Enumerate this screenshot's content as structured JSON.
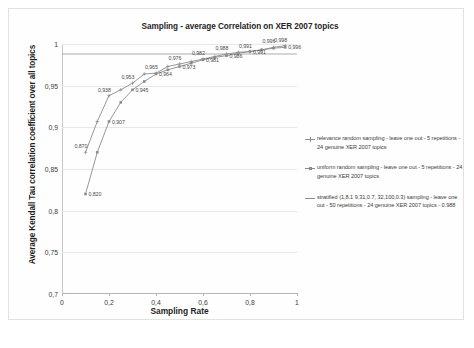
{
  "chart_data": {
    "type": "line",
    "title": "Sampling -  average Correlation on XER 2007 topics",
    "xlabel": "Sampling Rate",
    "ylabel": "Average Kendall Tau correlation coefficient over all topics",
    "xlim": [
      0,
      1
    ],
    "ylim": [
      0.7,
      1
    ],
    "grid": true,
    "legend_position": "right",
    "x_ticks": [
      "0",
      "0,2",
      "0,4",
      "0,6",
      "0,8",
      "1"
    ],
    "x_tick_values": [
      0,
      0.2,
      0.4,
      0.6,
      0.8,
      1
    ],
    "y_ticks": [
      "0,7",
      "0,75",
      "0,8",
      "0,85",
      "0,9",
      "0,95",
      "1"
    ],
    "y_tick_values": [
      0.7,
      0.75,
      0.8,
      0.85,
      0.9,
      0.95,
      1
    ],
    "series": [
      {
        "name": "relevance random sampling - leave one out - 5 repetitions - 24 genuine XER 2007 topics",
        "marker": "cross",
        "color": "#8c8c8c",
        "x": [
          0.1,
          0.15,
          0.2,
          0.25,
          0.3,
          0.35,
          0.4,
          0.45,
          0.5,
          0.55,
          0.6,
          0.65,
          0.7,
          0.75,
          0.8,
          0.85,
          0.9,
          0.95
        ],
        "values": [
          0.87,
          0.907,
          0.938,
          0.945,
          0.953,
          0.964,
          0.965,
          0.973,
          0.976,
          0.979,
          0.982,
          0.985,
          0.988,
          0.99,
          0.991,
          0.993,
          0.996,
          0.998
        ],
        "labels": [
          "0,870",
          "",
          "0,938",
          "",
          "0,953",
          "",
          "0,965",
          "",
          "0,976",
          "",
          "0,982",
          "",
          "0,988",
          "",
          "0,991",
          "",
          "0,996",
          "0,998"
        ]
      },
      {
        "name": "uniform random sampling - leave one out - 5 repetitions - 24 genuine XER 2007 topics",
        "marker": "square",
        "color": "#8c8c8c",
        "x": [
          0.1,
          0.15,
          0.2,
          0.25,
          0.3,
          0.35,
          0.4,
          0.45,
          0.5,
          0.55,
          0.6,
          0.65,
          0.7,
          0.75,
          0.8,
          0.85,
          0.9,
          0.95
        ],
        "values": [
          0.82,
          0.87,
          0.907,
          0.93,
          0.945,
          0.955,
          0.964,
          0.969,
          0.973,
          0.977,
          0.981,
          0.984,
          0.986,
          0.989,
          0.991,
          0.993,
          0.995,
          0.996
        ],
        "labels": [
          "0,820",
          "",
          "0,907",
          "",
          "0,945",
          "",
          "0,964",
          "",
          "0,973",
          "",
          "0,981",
          "",
          "0,986",
          "",
          "0,991",
          "",
          "",
          "0,996"
        ]
      },
      {
        "name": "stratified (1,8.1 9,31,0.7, 32,100,0.3) sampling - leave one out - 50 repetitions - 24 genuine XER 2007 topics - 0.988",
        "marker": "none",
        "color": "#9a9a9a",
        "constant": 0.988
      }
    ],
    "point_labels": [
      "0,820",
      "0,870",
      "0,907",
      "0,938",
      "0,945",
      "0,953",
      "0,964",
      "0,965",
      "0,973",
      "0,976",
      "0,982",
      "0,988",
      "0,991",
      "0,996",
      "0,998"
    ]
  },
  "legend": {
    "entries": [
      {
        "marker": "cross",
        "text": "relevance random sampling - leave one out - 5 repetitions - 24 genuine XER 2007 topics"
      },
      {
        "marker": "square",
        "text": "uniform random sampling - leave one out - 5 repetitions - 24 genuine XER 2007 topics"
      },
      {
        "marker": "plain",
        "text": "stratified (1,8.1 9,31,0.7, 32,100,0.3) sampling - leave one out - 50 repetitions - 24 genuine XER 2007 topics - 0.988"
      }
    ]
  },
  "colors": {
    "series_gray": "#8c8c8c",
    "gridline": "#e8e8e8",
    "axis": "#b4b4b4",
    "text": "#252525",
    "background": "#ffffff"
  }
}
